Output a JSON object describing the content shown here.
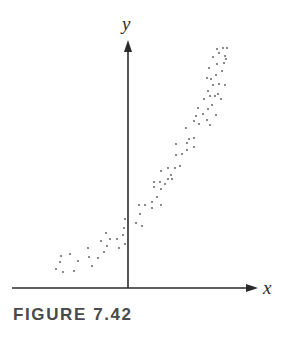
{
  "figure": {
    "caption": "FIGURE 7.42"
  },
  "chart_data": {
    "type": "scatter",
    "title": "",
    "xlabel": "x",
    "ylabel": "y",
    "grid": false,
    "legend": "none",
    "axes_style": "arrowed axes crossing at origin, no ticks",
    "xlim": [
      -11.6,
      13.0
    ],
    "ylim": [
      0,
      24.8
    ],
    "marker_color": "#6e6e6e",
    "axis_color": "#2a2a2a",
    "points": [
      {
        "x": -7.2,
        "y": 1.9
      },
      {
        "x": -6.7,
        "y": 3.2
      },
      {
        "x": -6.8,
        "y": 2.6
      },
      {
        "x": -6.5,
        "y": 1.6
      },
      {
        "x": -5.8,
        "y": 3.4
      },
      {
        "x": -5.4,
        "y": 1.7
      },
      {
        "x": -5.0,
        "y": 2.7
      },
      {
        "x": -4.0,
        "y": 4.0
      },
      {
        "x": -3.9,
        "y": 3.1
      },
      {
        "x": -3.6,
        "y": 2.2
      },
      {
        "x": -3.0,
        "y": 3.0
      },
      {
        "x": -2.7,
        "y": 4.7
      },
      {
        "x": -2.4,
        "y": 3.6
      },
      {
        "x": -2.2,
        "y": 5.5
      },
      {
        "x": -2.1,
        "y": 4.2
      },
      {
        "x": -1.8,
        "y": 4.9
      },
      {
        "x": -1.1,
        "y": 4.9
      },
      {
        "x": -0.9,
        "y": 4.0
      },
      {
        "x": -0.5,
        "y": 5.3
      },
      {
        "x": -0.4,
        "y": 6.0
      },
      {
        "x": -0.3,
        "y": 6.9
      },
      {
        "x": -0.3,
        "y": 4.4
      },
      {
        "x": 0.8,
        "y": 6.5
      },
      {
        "x": 1.4,
        "y": 6.2
      },
      {
        "x": 1.2,
        "y": 7.4
      },
      {
        "x": 1.1,
        "y": 8.3
      },
      {
        "x": 1.7,
        "y": 8.3
      },
      {
        "x": 2.4,
        "y": 8.0
      },
      {
        "x": 2.4,
        "y": 8.6
      },
      {
        "x": 3.3,
        "y": 8.3
      },
      {
        "x": 2.9,
        "y": 9.1
      },
      {
        "x": 3.3,
        "y": 9.9
      },
      {
        "x": 2.6,
        "y": 10.1
      },
      {
        "x": 2.6,
        "y": 10.6
      },
      {
        "x": 3.2,
        "y": 10.6
      },
      {
        "x": 3.7,
        "y": 10.4
      },
      {
        "x": 4.0,
        "y": 10.9
      },
      {
        "x": 4.4,
        "y": 10.9
      },
      {
        "x": 4.3,
        "y": 11.3
      },
      {
        "x": 3.3,
        "y": 11.7
      },
      {
        "x": 4.0,
        "y": 12.0
      },
      {
        "x": 4.7,
        "y": 12.0
      },
      {
        "x": 5.2,
        "y": 12.2
      },
      {
        "x": 4.8,
        "y": 13.3
      },
      {
        "x": 4.8,
        "y": 14.4
      },
      {
        "x": 5.4,
        "y": 13.4
      },
      {
        "x": 5.9,
        "y": 14.5
      },
      {
        "x": 5.9,
        "y": 13.8
      },
      {
        "x": 6.6,
        "y": 14.1
      },
      {
        "x": 6.1,
        "y": 14.9
      },
      {
        "x": 6.6,
        "y": 15.0
      },
      {
        "x": 5.8,
        "y": 16.0
      },
      {
        "x": 6.6,
        "y": 16.7
      },
      {
        "x": 7.1,
        "y": 16.4
      },
      {
        "x": 6.8,
        "y": 17.2
      },
      {
        "x": 7.0,
        "y": 18.0
      },
      {
        "x": 7.5,
        "y": 17.4
      },
      {
        "x": 7.9,
        "y": 16.8
      },
      {
        "x": 8.2,
        "y": 16.3
      },
      {
        "x": 8.0,
        "y": 17.9
      },
      {
        "x": 8.4,
        "y": 18.3
      },
      {
        "x": 8.8,
        "y": 17.3
      },
      {
        "x": 8.2,
        "y": 19.2
      },
      {
        "x": 8.7,
        "y": 19.2
      },
      {
        "x": 7.6,
        "y": 18.9
      },
      {
        "x": 8.0,
        "y": 19.7
      },
      {
        "x": 9.0,
        "y": 19.4
      },
      {
        "x": 9.3,
        "y": 18.9
      },
      {
        "x": 8.5,
        "y": 20.3
      },
      {
        "x": 8.3,
        "y": 20.9
      },
      {
        "x": 7.9,
        "y": 21.0
      },
      {
        "x": 8.8,
        "y": 21.3
      },
      {
        "x": 9.1,
        "y": 20.4
      },
      {
        "x": 9.7,
        "y": 20.3
      },
      {
        "x": 9.4,
        "y": 21.7
      },
      {
        "x": 8.1,
        "y": 22.0
      },
      {
        "x": 8.9,
        "y": 22.4
      },
      {
        "x": 9.6,
        "y": 22.5
      },
      {
        "x": 8.5,
        "y": 23.1
      },
      {
        "x": 9.1,
        "y": 23.5
      },
      {
        "x": 9.7,
        "y": 23.2
      },
      {
        "x": 8.9,
        "y": 23.9
      },
      {
        "x": 9.5,
        "y": 24.0
      },
      {
        "x": 9.9,
        "y": 24.0
      },
      {
        "x": 9.8,
        "y": 22.9
      }
    ]
  }
}
